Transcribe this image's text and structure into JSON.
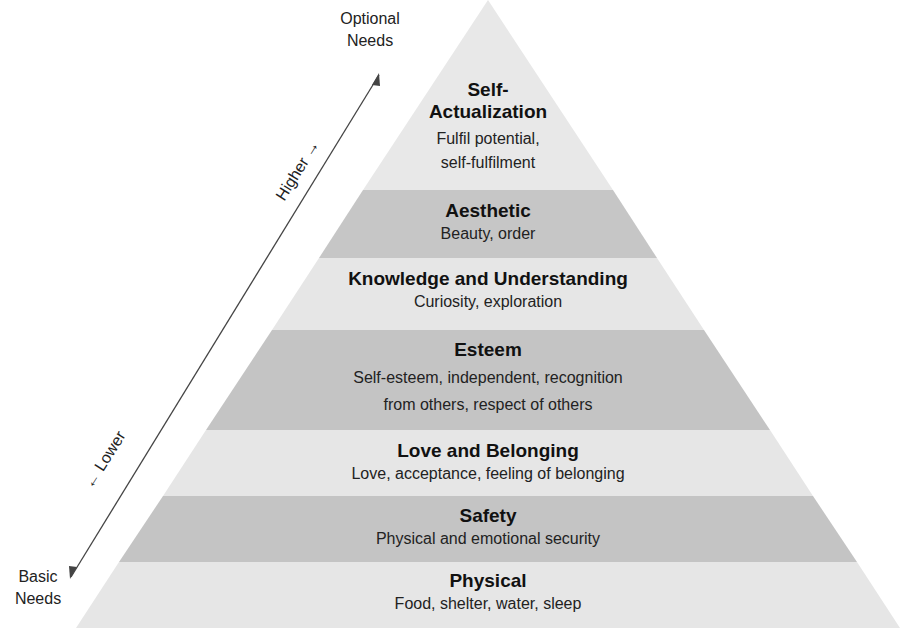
{
  "diagram": {
    "axis": {
      "top_label_line1": "Optional",
      "top_label_line2": "Needs",
      "bottom_label_line1": "Basic",
      "bottom_label_line2": "Needs",
      "higher_label": "Higher →",
      "lower_label": "← Lower"
    },
    "levels": [
      {
        "title_line1": "Self-",
        "title_line2": "Actualization",
        "desc_line1": "Fulfil potential,",
        "desc_line2": "self-fulfilment",
        "shade": "light"
      },
      {
        "title": "Aesthetic",
        "desc": "Beauty, order",
        "shade": "dark"
      },
      {
        "title": "Knowledge and Understanding",
        "desc": "Curiosity, exploration",
        "shade": "light"
      },
      {
        "title": "Esteem",
        "desc_line1": "Self-esteem, independent, recognition",
        "desc_line2": "from others, respect of others",
        "shade": "dark"
      },
      {
        "title": "Love and Belonging",
        "desc": "Love, acceptance, feeling of belonging",
        "shade": "light"
      },
      {
        "title": "Safety",
        "desc": "Physical and emotional security",
        "shade": "dark"
      },
      {
        "title": "Physical",
        "desc": "Food, shelter, water, sleep",
        "shade": "light"
      }
    ],
    "colors": {
      "light": "#e6e6e6",
      "dark": "#c4c4c4",
      "text": "#1a1a1a",
      "arrow": "#444444"
    }
  }
}
